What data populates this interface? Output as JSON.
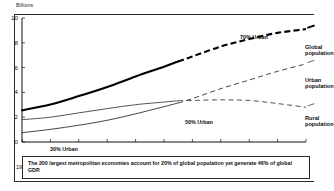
{
  "chart_data": {
    "type": "line",
    "title": "",
    "subtitle": "",
    "xlabel": "",
    "ylabel": "Billions",
    "unit_label": "Billions",
    "xlim": [
      1950,
      2050
    ],
    "ylim": [
      0,
      10
    ],
    "grid": false,
    "legend_position": "right",
    "x_ticks": [
      "1950",
      "1960",
      "1970",
      "1980",
      "1990",
      "2000",
      "2010",
      "2020",
      "2030",
      "2040",
      "2050"
    ],
    "y_ticks": [
      "0",
      "2",
      "4",
      "6",
      "8",
      "10"
    ],
    "historical_end_year": 2005,
    "series": [
      {
        "name": "Global population",
        "style": "solid-then-dashed",
        "thickness": "thick",
        "color": "#000000",
        "x": [
          1950,
          1960,
          1970,
          1980,
          1990,
          2000,
          2005,
          2010,
          2020,
          2030,
          2040,
          2050
        ],
        "values": [
          2.55,
          3.02,
          3.7,
          4.44,
          5.28,
          6.07,
          6.5,
          6.9,
          7.7,
          8.3,
          8.8,
          9.1
        ]
      },
      {
        "name": "Urban population",
        "style": "solid-then-dashed",
        "thickness": "thin",
        "color": "#3a3a3a",
        "x": [
          1950,
          1960,
          1970,
          1980,
          1990,
          2000,
          2005,
          2010,
          2020,
          2030,
          2040,
          2050
        ],
        "values": [
          0.75,
          1.02,
          1.35,
          1.75,
          2.27,
          2.85,
          3.15,
          3.5,
          4.3,
          5.0,
          5.7,
          6.3
        ]
      },
      {
        "name": "Rural population",
        "style": "solid-then-dashed",
        "thickness": "thin",
        "color": "#4a4a4a",
        "x": [
          1950,
          1960,
          1970,
          1980,
          1990,
          2000,
          2005,
          2010,
          2020,
          2030,
          2040,
          2050
        ],
        "values": [
          1.8,
          2.0,
          2.35,
          2.69,
          3.01,
          3.22,
          3.33,
          3.35,
          3.4,
          3.35,
          3.1,
          2.8
        ]
      }
    ],
    "annotations": [
      {
        "text": "70% Urban",
        "x": 2042,
        "y": 9.6
      },
      {
        "text": "50% Urban",
        "x": 2008,
        "y": 2.55
      },
      {
        "text": "30% Urban",
        "x": 1953,
        "y": 0.35
      }
    ],
    "legend": [
      {
        "label_line1": "Global",
        "label_line2": "population"
      },
      {
        "label_line1": "Urban",
        "label_line2": "population"
      },
      {
        "label_line1": "Rural",
        "label_line2": "population"
      }
    ]
  },
  "footnote": {
    "text": "The 200 largest metropolitan economies account for 20% of global population yet generate 46% of global GDP."
  }
}
